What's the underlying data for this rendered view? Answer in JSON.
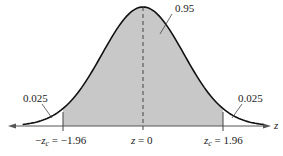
{
  "chart_data": {
    "type": "area",
    "title": "",
    "xlabel": "z",
    "ylabel": "",
    "distribution": "standard normal",
    "mean": 0,
    "critical_value": 1.96,
    "regions": [
      {
        "name": "left-tail",
        "from": "-inf",
        "to": -1.96,
        "area": 0.025,
        "shaded": false
      },
      {
        "name": "center",
        "from": -1.96,
        "to": 1.96,
        "area": 0.95,
        "shaded": true
      },
      {
        "name": "right-tail",
        "from": 1.96,
        "to": "inf",
        "area": 0.025,
        "shaded": false
      }
    ],
    "annotations": {
      "center_area": "0.95",
      "left_tail_area": "0.025",
      "right_tail_area": "0.025"
    },
    "tick_labels": {
      "left": {
        "prefix": "−",
        "var": "z",
        "sub": "c",
        "eq": " = −1.96"
      },
      "center": {
        "var": "z",
        "eq": " = 0"
      },
      "right": {
        "var": "z",
        "sub": "c",
        "eq": " = 1.96"
      }
    },
    "axis_label": "z",
    "grid": false,
    "colors": {
      "shade": "#c8c8c8",
      "curve": "#111111",
      "axis": "#555555"
    }
  }
}
